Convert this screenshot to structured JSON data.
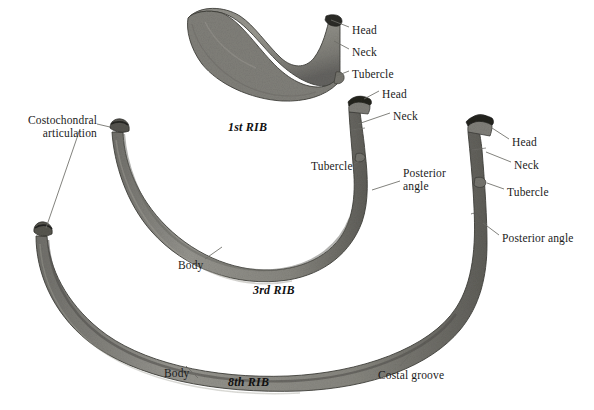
{
  "figure": {
    "background_color": "#ffffff",
    "bone_fill": "#8d8c86",
    "bone_fill_dark": "#5f5e59",
    "bone_edge": "#3a3a36",
    "label_color": "#1b1b1b",
    "leader_color": "#6b6b66",
    "width": 594,
    "height": 410
  },
  "specimens": [
    {
      "id": "rib-1",
      "caption": "1st RIB",
      "caption_x": 228,
      "caption_y": 120,
      "labels": [
        {
          "name": "head",
          "text": "Head",
          "x": 352,
          "y": 24
        },
        {
          "name": "neck",
          "text": "Neck",
          "x": 352,
          "y": 46
        },
        {
          "name": "tubercle",
          "text": "Tubercle",
          "x": 352,
          "y": 68
        }
      ]
    },
    {
      "id": "rib-3",
      "caption": "3rd RIB",
      "caption_x": 253,
      "caption_y": 283,
      "labels": [
        {
          "name": "costochondral-articulation",
          "text": "Costochondral\narticulation",
          "x": 22,
          "y": 114
        },
        {
          "name": "head",
          "text": "Head",
          "x": 382,
          "y": 88
        },
        {
          "name": "neck",
          "text": "Neck",
          "x": 393,
          "y": 110
        },
        {
          "name": "tubercle",
          "text": "Tubercle",
          "x": 311,
          "y": 160
        },
        {
          "name": "posterior-angle",
          "text": "Posterior\nangle",
          "x": 403,
          "y": 167
        },
        {
          "name": "body",
          "text": "Body",
          "x": 178,
          "y": 259
        }
      ]
    },
    {
      "id": "rib-8",
      "caption": "8th RIB",
      "caption_x": 228,
      "caption_y": 375,
      "labels": [
        {
          "name": "head",
          "text": "Head",
          "x": 512,
          "y": 136
        },
        {
          "name": "neck",
          "text": "Neck",
          "x": 514,
          "y": 159
        },
        {
          "name": "tubercle",
          "text": "Tubercle",
          "x": 507,
          "y": 186
        },
        {
          "name": "posterior-angle",
          "text": "Posterior angle",
          "x": 502,
          "y": 232
        },
        {
          "name": "body",
          "text": "Body",
          "x": 164,
          "y": 367
        },
        {
          "name": "costal-groove",
          "text": "Costal groove",
          "x": 378,
          "y": 369
        }
      ]
    }
  ]
}
